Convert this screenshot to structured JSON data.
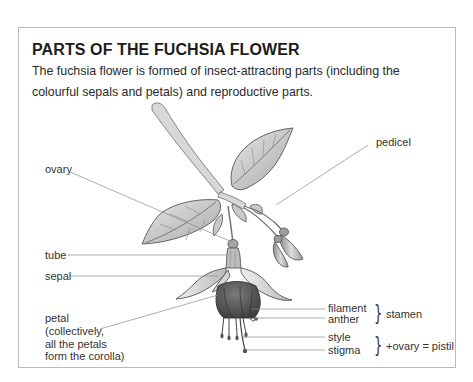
{
  "figure": {
    "title": "PARTS OF THE FUCHSIA FLOWER",
    "description": "The fuchsia flower is formed of insect-attracting parts (including the colourful sepals and petals) and reproductive parts.",
    "illustration": "fuchsia-flower-with-leaves-and-buds"
  },
  "labels": {
    "ovary": "ovary",
    "pedicel": "pedicel",
    "tube": "tube",
    "sepal": "sepal",
    "petal": "petal\n(collectively,\nall the petals\nform the corolla)",
    "filament": "filament",
    "anther": "anther",
    "style": "style",
    "stigma": "stigma"
  },
  "groups": {
    "stamen": {
      "brace": "}",
      "label": "stamen",
      "members": [
        "filament",
        "anther"
      ]
    },
    "pistil": {
      "brace": "}",
      "label": "+ovary = pistil",
      "members": [
        "style",
        "stigma"
      ]
    }
  },
  "colors": {
    "border": "#b9b9b9",
    "leader_line": "#8a8a8a",
    "text": "#333333",
    "title": "#1c1c1c"
  }
}
